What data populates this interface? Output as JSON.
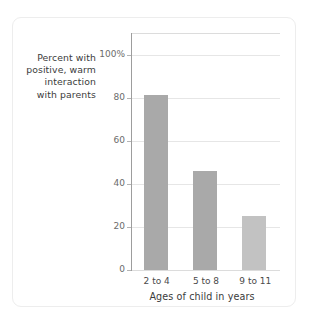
{
  "chart_data": {
    "type": "bar",
    "title": "",
    "categories": [
      "2 to 4",
      "5 to 8",
      "9 to 11"
    ],
    "values": [
      81,
      46,
      25
    ],
    "bar_colors": [
      "#a9a9a9",
      "#a9a9a9",
      "#c2c2c2"
    ],
    "xlabel": "Ages of child in years",
    "ylabel": "Percent with positive, warm interaction with parents",
    "ylabel_lines": [
      "Percent with",
      "positive, warm",
      "interaction",
      "with parents"
    ],
    "ylim": [
      0,
      110
    ],
    "yticks": [
      0,
      20,
      40,
      60,
      80,
      100
    ],
    "ytick_labels": [
      "0",
      "20",
      "40",
      "60",
      "80",
      "100%"
    ],
    "grid": true,
    "legend": "none",
    "axis_color": "#9d9d9d",
    "gridline_color": "#e6e6e6",
    "card_border_color": "#ededed",
    "background": "#ffffff"
  }
}
